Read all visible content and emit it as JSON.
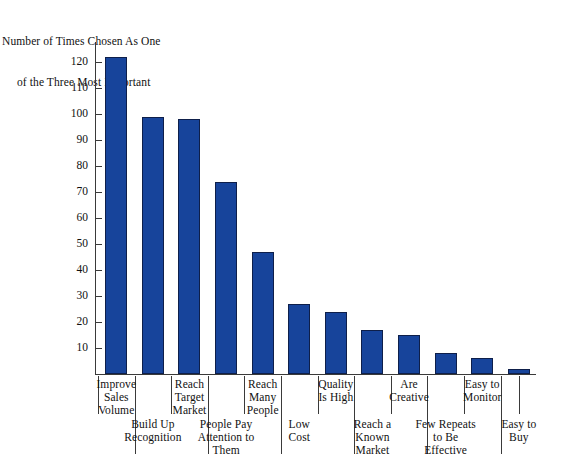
{
  "axis_caption": {
    "line1": "Number of Times Chosen As One",
    "line2": "of the Three Most Important"
  },
  "title_remnant": "",
  "chart_data": {
    "type": "bar",
    "title": "",
    "subtitle": "",
    "xlabel": "",
    "ylabel": "Number of Times Chosen As One of the Three Most Important",
    "ylim": [
      0,
      130
    ],
    "ytick_step": 10,
    "yticks": [
      10,
      20,
      30,
      40,
      50,
      60,
      70,
      80,
      90,
      100,
      110,
      120
    ],
    "ytick_labels": [
      "10",
      "20",
      "30",
      "40",
      "50",
      "60",
      "70",
      "80",
      "90",
      "100",
      "110",
      "120"
    ],
    "grid": false,
    "legend": null,
    "bar_color": "#17449b",
    "bar_edge_color": "#0e1f4a",
    "axis_color": "#3a3a3a",
    "categories": [
      "Improve\nSales\nVolume",
      "Build Up\nRecognition",
      "Reach\nTarget\nMarket",
      "People Pay\nAttention to\nThem",
      "Reach\nMany\nPeople",
      "Low\nCost",
      "Quality\nIs High",
      "Reach a\nKnown\nMarket",
      "Are\nCreative",
      "Few Repeats\nto Be\nEffective",
      "Easy to\nMonitor",
      "Easy to\nBuy"
    ],
    "category_label_rows": [
      "top",
      "bottom",
      "top",
      "bottom",
      "top",
      "bottom",
      "top",
      "bottom",
      "top",
      "bottom",
      "top",
      "bottom"
    ],
    "values": [
      122,
      99,
      98,
      74,
      47,
      27,
      24,
      17,
      15,
      8,
      6,
      2
    ]
  }
}
